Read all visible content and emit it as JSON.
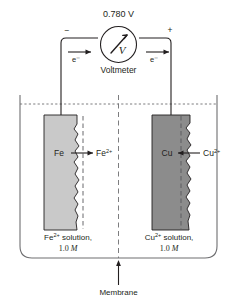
{
  "figure": {
    "meter": {
      "reading": "0.780 V",
      "device_label": "Voltmeter",
      "dial_symbol": "V",
      "terminal_negative": "−",
      "terminal_positive": "+",
      "electron_label_left": "e⁻",
      "electron_label_right": "e⁻"
    },
    "left_half_cell": {
      "electrode_label": "Fe",
      "ion_base": "Fe",
      "ion_charge": "2+",
      "solution_name_base": "Fe",
      "solution_name_charge": "2+",
      "solution_name_rest": " solution,",
      "concentration_value": "1.0 ",
      "concentration_unit": "M",
      "electrode_color": "#c9c9c9",
      "reaction_direction": "oxidation-outward"
    },
    "right_half_cell": {
      "electrode_label": "Cu",
      "ion_base": "Cu",
      "ion_charge": "2+",
      "solution_name_base": "Cu",
      "solution_name_charge": "2+",
      "solution_name_rest": " solution,",
      "concentration_value": "1.0 ",
      "concentration_unit": "M",
      "electrode_color": "#8c8c8c",
      "reaction_direction": "reduction-inward"
    },
    "membrane": {
      "label": "Membrane"
    },
    "colors": {
      "ink": "#231f20",
      "beaker_line": "#6e6e70",
      "fe_electrode": "#c9c9c9",
      "cu_electrode": "#8c8c8c"
    }
  }
}
